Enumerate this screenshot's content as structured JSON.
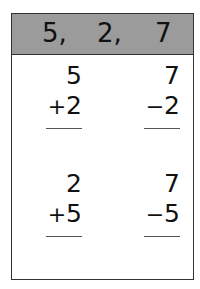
{
  "header": {
    "numbers": [
      "5,",
      "2,",
      "7"
    ],
    "background": "#9b9b9b"
  },
  "problems": [
    {
      "top": "5",
      "op": "+",
      "bottom": "2"
    },
    {
      "top": "7",
      "op": "−",
      "bottom": "2"
    },
    {
      "top": "2",
      "op": "+",
      "bottom": "5"
    },
    {
      "top": "7",
      "op": "−",
      "bottom": "5"
    }
  ]
}
